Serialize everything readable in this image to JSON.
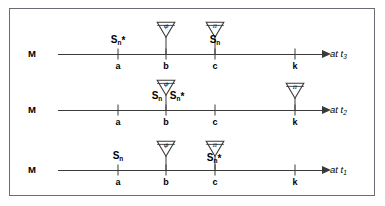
{
  "figure": {
    "background": "#ffffff",
    "border_color": "#6b6b73",
    "line_color": "#3a3a3a",
    "text_color": "#000000"
  },
  "axis": {
    "memory_label": "M",
    "tick_labels": [
      "a",
      "b",
      "c",
      "k"
    ],
    "tick_x": [
      118,
      166,
      215,
      295
    ],
    "axis_start_x": 58,
    "axis_end_x": 322,
    "arrow_label_x": 330
  },
  "rows": [
    {
      "id": "row-t3",
      "time_label": "at t",
      "time_sub": "3",
      "axis_y": 54,
      "items": [
        {
          "name": "s-n-star-at-a",
          "text": "S",
          "sub": "n",
          "star": "*",
          "x": 118,
          "y": 45
        },
        {
          "name": "s-n-at-c",
          "text": "S",
          "sub": "n",
          "star": "",
          "x": 215,
          "y": 45
        }
      ],
      "tokens": [
        {
          "name": "phi-token-at-b",
          "glyph": "φ",
          "x": 166,
          "y": 21
        },
        {
          "name": "pi-token-at-c",
          "glyph": "π",
          "x": 215,
          "y": 21
        }
      ]
    },
    {
      "id": "row-t2",
      "time_label": "at t",
      "time_sub": "2",
      "axis_y": 110,
      "items": [
        {
          "name": "s-n-s-n-star-at-b",
          "text": "S",
          "sub": "n",
          "star": "",
          "x": 157,
          "y": 101
        },
        {
          "name": "s-n-star-at-b",
          "text": "S",
          "sub": "n",
          "star": "*",
          "x": 177,
          "y": 101
        }
      ],
      "tokens": [
        {
          "name": "phi-token-at-b",
          "glyph": "φ",
          "x": 166,
          "y": 79
        },
        {
          "name": "pi-token-at-k",
          "glyph": "π",
          "x": 295,
          "y": 82
        }
      ]
    },
    {
      "id": "row-t1",
      "time_label": "at t",
      "time_sub": "1",
      "axis_y": 170,
      "items": [
        {
          "name": "s-n-at-a",
          "text": "S",
          "sub": "n",
          "star": "",
          "x": 118,
          "y": 161
        },
        {
          "name": "s-n-star-at-c",
          "text": "S",
          "sub": "n",
          "star": "*",
          "x": 214,
          "y": 163
        }
      ],
      "tokens": [
        {
          "name": "phi-token-at-b",
          "glyph": "φ",
          "x": 166,
          "y": 140
        },
        {
          "name": "pi-token-at-c",
          "glyph": "π",
          "x": 215,
          "y": 140
        }
      ]
    }
  ]
}
